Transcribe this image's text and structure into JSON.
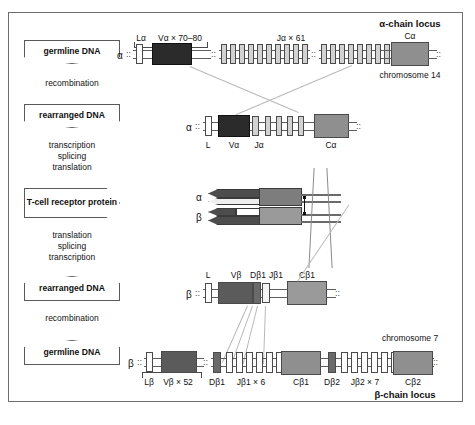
{
  "figure": {
    "title_alpha": "α-chain locus",
    "title_beta": "β-chain locus",
    "chromosome_alpha": "chromosome 14",
    "chromosome_beta": "chromosome 7"
  },
  "stages": {
    "germline_top": "germline DNA",
    "germline_bottom": "germline DNA",
    "rearranged_top": "rearranged DNA",
    "rearranged_bottom": "rearranged DNA",
    "protein": "T-cell receptor protein"
  },
  "processes": {
    "recombination_top": "recombination",
    "transcription_splicing_translation": [
      "transcription",
      "splicing",
      "translation"
    ],
    "translation_splicing_transcription": [
      "translation",
      "splicing",
      "transcription"
    ],
    "recombination_bottom": "recombination"
  },
  "chain_labels": {
    "alpha_germline": "α",
    "alpha_rearranged": "α",
    "alpha_protein": "α",
    "beta_protein": "β",
    "beta_rearranged": "β",
    "beta_germline": "β"
  },
  "alpha_germline": {
    "leader_label": "Lα",
    "v_label": "Vα × 70–80",
    "j_label": "Jα × 61",
    "c_label": "Cα",
    "j_count_group1": 10,
    "j_count_group2": 10
  },
  "alpha_rearranged": {
    "l_label": "L",
    "v_label": "Vα",
    "j_label": "Jα",
    "c_label": "Cα",
    "extra_j_count": 4
  },
  "beta_rearranged": {
    "l_label": "L",
    "v_label": "Vβ",
    "d_label": "Dβ1",
    "j_label": "Jβ1",
    "c_label": "Cβ1"
  },
  "beta_germline": {
    "leader_label": "Lβ",
    "v_label": "Vβ × 52",
    "d1_label": "Dβ1",
    "j1_label": "Jβ1 × 6",
    "c1_label": "Cβ1",
    "d2_label": "Dβ2",
    "j2_label": "Jβ2 × 7",
    "c2_label": "Cβ2",
    "j1_count": 6,
    "j2_count": 7
  },
  "colors": {
    "v_segment": "#2b2b2b",
    "v_segment_beta": "#5b5b5b",
    "c_segment": "#8f8f8f",
    "j_segment": "#d2d2d2",
    "l_segment": "#ffffff",
    "d_segment": "#6a6a6a",
    "frame": "#6e6e6e",
    "lead_line": "#b9b9b9"
  }
}
